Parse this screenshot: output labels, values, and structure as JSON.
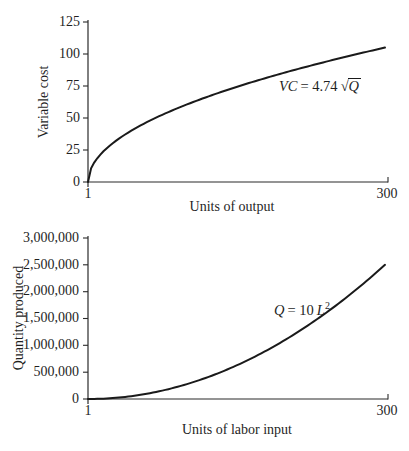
{
  "figure": {
    "background": "#ffffff",
    "text_color": "#1f1f1f",
    "line_color": "#1a1a1a"
  },
  "chart_data": [
    {
      "type": "line",
      "title": "",
      "xlabel": "Units of output",
      "ylabel": "Variable cost",
      "x_tick_labels": [
        "1",
        "300"
      ],
      "y_tick_labels": [
        "0",
        "25",
        "50",
        "75",
        "100",
        "125"
      ],
      "xlim": [
        1,
        300
      ],
      "ylim": [
        0,
        125
      ],
      "grid": false,
      "legend": "none",
      "equation": {
        "lhs": "VC",
        "mid": "= 4.74",
        "radical": "√",
        "radicand": "Q",
        "text": "VC = 4.74√Q"
      },
      "curve": {
        "exponent": 0.5,
        "y_start": 0,
        "y_end": 105
      },
      "points": [
        {
          "x": 1,
          "y": 0
        },
        {
          "x": 25,
          "y": 30
        },
        {
          "x": 50,
          "y": 43
        },
        {
          "x": 100,
          "y": 60
        },
        {
          "x": 150,
          "y": 74
        },
        {
          "x": 200,
          "y": 86
        },
        {
          "x": 250,
          "y": 96
        },
        {
          "x": 300,
          "y": 105
        }
      ]
    },
    {
      "type": "line",
      "title": "",
      "xlabel": "Units of labor input",
      "ylabel": "Quantity produced",
      "x_tick_labels": [
        "1",
        "300"
      ],
      "y_tick_labels": [
        "0",
        "500,000",
        "1,000,000",
        "1,500,000",
        "2,000,000",
        "2,500,000",
        "3,000,000"
      ],
      "xlim": [
        1,
        300
      ],
      "ylim": [
        0,
        3000000
      ],
      "grid": false,
      "legend": "none",
      "equation": {
        "lhs": "Q",
        "mid": "= 10",
        "base": "L",
        "sup": "2",
        "text": "Q = 10L²"
      },
      "curve": {
        "exponent": 2,
        "y_start": 0,
        "y_end": 2500000
      },
      "points": [
        {
          "x": 1,
          "y": 0
        },
        {
          "x": 50,
          "y": 67000
        },
        {
          "x": 100,
          "y": 274000
        },
        {
          "x": 150,
          "y": 621000
        },
        {
          "x": 200,
          "y": 1108000
        },
        {
          "x": 250,
          "y": 1734000
        },
        {
          "x": 300,
          "y": 2500000
        }
      ]
    }
  ]
}
